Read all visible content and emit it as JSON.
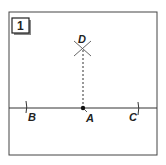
{
  "diagram": {
    "step_number": "1",
    "points": {
      "A": {
        "label": "A",
        "x": 83,
        "y": 108
      },
      "B": {
        "label": "B",
        "x": 27,
        "y": 108
      },
      "C": {
        "label": "C",
        "x": 139,
        "y": 108
      },
      "D": {
        "label": "D",
        "x": 82,
        "y": 47
      }
    },
    "colors": {
      "stroke": "#333333",
      "background": "#ffffff"
    }
  }
}
